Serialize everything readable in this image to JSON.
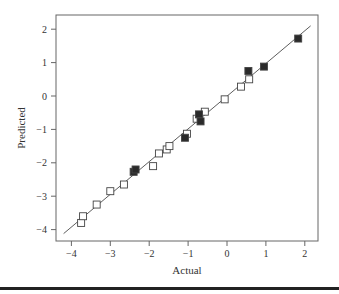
{
  "chart_data": {
    "type": "scatter",
    "title": "",
    "xlabel": "Actual",
    "ylabel": "Predicted",
    "xlim": [
      -4.4,
      2.35
    ],
    "ylim": [
      -4.35,
      2.45
    ],
    "x_ticks": [
      -4,
      -3,
      -2,
      -1,
      0,
      1,
      2
    ],
    "y_ticks": [
      -4,
      -3,
      -2,
      -1,
      0,
      1,
      2
    ],
    "x_tick_labels": [
      "−4",
      "−3",
      "−2",
      "−1",
      "0",
      "1",
      "2"
    ],
    "y_tick_labels": [
      "−4",
      "−3",
      "−2",
      "−1",
      "0",
      "1",
      "2"
    ],
    "grid": false,
    "reference_line": {
      "from": [
        -4.2,
        -4.12
      ],
      "to": [
        2.15,
        2.1
      ],
      "label": "y = x fit line"
    },
    "series": [
      {
        "name": "Open squares",
        "marker": "open-square",
        "points": [
          [
            -3.75,
            -3.8
          ],
          [
            -3.7,
            -3.6
          ],
          [
            -3.35,
            -3.25
          ],
          [
            -3.0,
            -2.85
          ],
          [
            -2.65,
            -2.65
          ],
          [
            -1.9,
            -2.1
          ],
          [
            -1.75,
            -1.72
          ],
          [
            -1.55,
            -1.6
          ],
          [
            -1.48,
            -1.5
          ],
          [
            -1.03,
            -1.13
          ],
          [
            -0.78,
            -0.68
          ],
          [
            -0.57,
            -0.47
          ],
          [
            -0.06,
            -0.1
          ],
          [
            0.36,
            0.28
          ],
          [
            0.57,
            0.5
          ]
        ]
      },
      {
        "name": "Filled squares",
        "marker": "filled-square",
        "points": [
          [
            -2.4,
            -2.27
          ],
          [
            -2.35,
            -2.2
          ],
          [
            -1.08,
            -1.25
          ],
          [
            -0.72,
            -0.55
          ],
          [
            -0.68,
            -0.76
          ],
          [
            0.55,
            0.75
          ],
          [
            0.95,
            0.88
          ],
          [
            1.83,
            1.72
          ]
        ]
      }
    ]
  },
  "colors": {
    "frame": "#555555",
    "line": "#333333",
    "open_fill": "#ffffff",
    "filled_fill": "#2a2a2a",
    "bottom_rule": "#222222"
  }
}
